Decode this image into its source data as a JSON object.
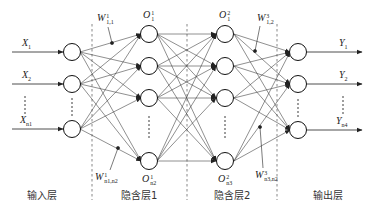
{
  "diagram": {
    "type": "neural-network",
    "layers": [
      {
        "name": "输入层",
        "node_count_symbol": "n1"
      },
      {
        "name": "隐含层1",
        "node_count_symbol": "n2"
      },
      {
        "name": "隐含层2",
        "node_count_symbol": "n3"
      },
      {
        "name": "输出层",
        "node_count_symbol": "n4"
      }
    ],
    "inputs": [
      {
        "symbol": "X",
        "sub": "1"
      },
      {
        "symbol": "X",
        "sub": "2"
      },
      {
        "symbol": "X",
        "sub": "n1"
      }
    ],
    "outputs": [
      {
        "symbol": "Y",
        "sub": "1"
      },
      {
        "symbol": "Y",
        "sub": "2"
      },
      {
        "symbol": "Y",
        "sub": "n4"
      }
    ],
    "hidden1_labels": {
      "top": {
        "symbol": "O",
        "sup": "1",
        "sub": "1"
      },
      "bottom": {
        "symbol": "O",
        "sup": "1",
        "sub": "n2"
      }
    },
    "hidden2_labels": {
      "top": {
        "symbol": "O",
        "sup": "2",
        "sub": "1"
      },
      "bottom": {
        "symbol": "O",
        "sup": "2",
        "sub": "n3"
      }
    },
    "weights": [
      {
        "symbol": "W",
        "sup": "1",
        "sub": "1,1"
      },
      {
        "symbol": "W",
        "sup": "1",
        "sub": "n1,n2"
      },
      {
        "symbol": "W",
        "sup": "3",
        "sub": "1,2"
      },
      {
        "symbol": "W",
        "sup": "3",
        "sub": "n3,n2"
      }
    ],
    "ellipsis": "⋮"
  }
}
